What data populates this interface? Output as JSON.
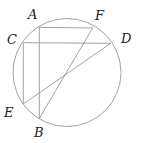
{
  "diagram": {
    "circle": {
      "cx": 67,
      "cy": 72.5,
      "r": 54
    },
    "points": {
      "A": {
        "x": 39.3,
        "y": 27.3,
        "label": "A",
        "lx": 28,
        "ly": 19
      },
      "F": {
        "x": 92.7,
        "y": 28,
        "label": "F",
        "lx": 95,
        "ly": 20
      },
      "C": {
        "x": 23.3,
        "y": 42.7,
        "label": "C",
        "lx": 7,
        "ly": 44
      },
      "D": {
        "x": 110.7,
        "y": 43.3,
        "label": "D",
        "lx": 121,
        "ly": 43
      },
      "E": {
        "x": 23.3,
        "y": 104,
        "label": "E",
        "lx": 4,
        "ly": 117
      },
      "B": {
        "x": 39.3,
        "y": 118.3,
        "label": "B",
        "lx": 34,
        "ly": 137
      }
    },
    "segments": [
      [
        "A",
        "F"
      ],
      [
        "C",
        "D"
      ],
      [
        "A",
        "B"
      ],
      [
        "C",
        "E"
      ],
      [
        "E",
        "D"
      ],
      [
        "B",
        "F"
      ]
    ],
    "colors": {
      "stroke": "#8a8a8a",
      "label": "#222222"
    }
  }
}
